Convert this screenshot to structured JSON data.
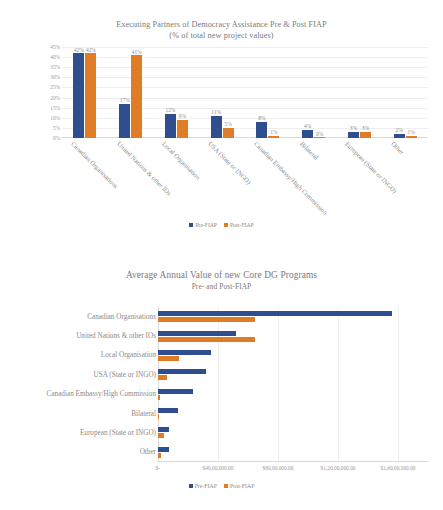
{
  "chart_data": [
    {
      "type": "bar",
      "orientation": "vertical",
      "title": "Executing Partners of Democracy Assistance Pre & Post FIAP",
      "subtitle": "(% of total new project values)",
      "xlabel": "",
      "ylabel": "",
      "ylim": [
        0,
        45
      ],
      "ytick_labels": [
        "45%",
        "40%",
        "35%",
        "30%",
        "25%",
        "20%",
        "15%",
        "10%",
        "5%",
        "0%"
      ],
      "ytick_values": [
        45,
        40,
        35,
        30,
        25,
        20,
        15,
        10,
        5,
        0
      ],
      "grid": true,
      "legend_position": "bottom",
      "categories": [
        "Canadian Organisations",
        "United Nations & other IOs",
        "Local Organisation",
        "USA (State or INGO)",
        "Canadian Embassy/High Commission",
        "Bilateral",
        "European (State or INGO)",
        "Other"
      ],
      "series": [
        {
          "name": "Pre-FIAP",
          "color": "#2e4e8f",
          "values": [
            42,
            17,
            12,
            11,
            8,
            4,
            3,
            2
          ],
          "labels": [
            "42%",
            "17%",
            "12%",
            "11%",
            "8%",
            "4%",
            "3%",
            "2%"
          ]
        },
        {
          "name": "Post-FIAP",
          "color": "#e07b26",
          "values": [
            42,
            41,
            9,
            5,
            1,
            0,
            3,
            1
          ],
          "labels": [
            "42%",
            "41%",
            "9%",
            "5%",
            "1%",
            "0%",
            "3%",
            "1%"
          ]
        }
      ]
    },
    {
      "type": "bar",
      "orientation": "horizontal",
      "title": "Average Annual Value of new Core DG Programs",
      "subtitle": "Pre- and Post-FIAP",
      "xlabel": "",
      "ylabel": "",
      "xlim": [
        0,
        18000000
      ],
      "xtick_labels": [
        "$-",
        "$40,00,000.00",
        "$80,00,000.00",
        "$1,20,00,000.00",
        "$1,60,00,000.00"
      ],
      "xtick_values": [
        0,
        4000000,
        8000000,
        12000000,
        16000000
      ],
      "grid": true,
      "legend_position": "bottom",
      "categories": [
        "Canadian Organisations",
        "United Nations & other IOs",
        "Local Organisation",
        "USA (State or INGO)",
        "Canadian Embassy/High Commission",
        "Bilateral",
        "European (State or INGO)",
        "Other"
      ],
      "series": [
        {
          "name": "Pre-FIAP",
          "color": "#2e4e8f",
          "values": [
            15600000,
            5200000,
            3500000,
            3200000,
            2300000,
            1300000,
            750000,
            700000
          ]
        },
        {
          "name": "Post-FIAP",
          "color": "#e07b26",
          "values": [
            6450000,
            6450000,
            1400000,
            600000,
            120000,
            0,
            420000,
            200000
          ]
        }
      ]
    }
  ],
  "chart1": {
    "title": "Executing Partners of Democracy Assistance Pre & Post FIAP",
    "subtitle": "(% of total new project values)",
    "ytick_labels": [
      "45%",
      "40%",
      "35%",
      "30%",
      "25%",
      "20%",
      "15%",
      "10%",
      "5%",
      "0%"
    ],
    "categories": [
      "Canadian Organisations",
      "United Nations & other IOs",
      "Local Organisation",
      "USA (State or INGO)",
      "Canadian Embassy/High Commission",
      "Bilateral",
      "European (State or INGO)",
      "Other"
    ],
    "pre_labels": [
      "42%",
      "17%",
      "12%",
      "11%",
      "8%",
      "4%",
      "3%",
      "2%"
    ],
    "post_labels": [
      "42%",
      "41%",
      "9%",
      "5%",
      "1%",
      "0%",
      "3%",
      "1%"
    ],
    "legend": {
      "pre": "Pre-FIAP",
      "post": "Post-FIAP"
    }
  },
  "chart2": {
    "title": "Average Annual Value of new Core DG Programs",
    "subtitle": "Pre- and Post-FIAP",
    "categories": [
      "Canadian Organisations",
      "United Nations & other IOs",
      "Local Organisation",
      "USA (State or INGO)",
      "Canadian Embassy/High Commission",
      "Bilateral",
      "European (State or INGO)",
      "Other"
    ],
    "xtick_labels": [
      "$-",
      "$40,00,000.00",
      "$80,00,000.00",
      "$1,20,00,000.00",
      "$1,60,00,000.00"
    ],
    "legend": {
      "pre": "Pre-FIAP",
      "post": "Post-FIAP"
    }
  },
  "colors": {
    "pre": "#2e4e8f",
    "post": "#e07b26",
    "grid": "#efefef",
    "text": "#8a8a8a"
  }
}
